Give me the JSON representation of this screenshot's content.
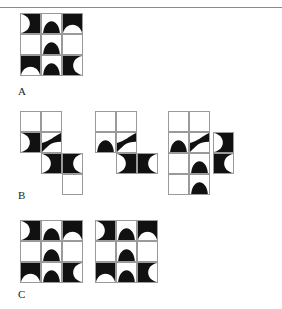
{
  "page": {
    "width": 282,
    "height": 309,
    "background": "#ffffff",
    "ink_color": "#111111",
    "grid_line_color": "#9a9a9a",
    "rule_color": "#8a8a8a",
    "has_top_rule": true
  },
  "labels": {
    "a": "A",
    "b": "B",
    "c": "C"
  },
  "figure_groups": [
    {
      "id": "group-a",
      "label": "A",
      "caption": "A",
      "figure_count": 1,
      "figures": [
        {
          "id": "a1",
          "name": "figure-a-1",
          "cols": 3,
          "rows": 3,
          "cell_size": 21,
          "x": 20,
          "y": 13,
          "cells": [
            {
              "col": 0,
              "row": 0,
              "tile": "arc-right"
            },
            {
              "col": 1,
              "row": 0,
              "tile": "hump-up"
            },
            {
              "col": 2,
              "row": 0,
              "tile": "arc-down"
            },
            {
              "col": 0,
              "row": 1,
              "tile": "blank"
            },
            {
              "col": 1,
              "row": 1,
              "tile": "hump-up"
            },
            {
              "col": 2,
              "row": 1,
              "tile": "blank"
            },
            {
              "col": 0,
              "row": 2,
              "tile": "arc-down"
            },
            {
              "col": 1,
              "row": 2,
              "tile": "hump-up"
            },
            {
              "col": 2,
              "row": 2,
              "tile": "arc-left"
            }
          ]
        }
      ]
    },
    {
      "id": "group-b",
      "label": "B",
      "caption": "B",
      "figure_count": 4,
      "figures": [
        {
          "id": "b1",
          "name": "figure-b-1",
          "cols": 3,
          "rows": 4,
          "cell_size": 21,
          "x": 20,
          "y": 111,
          "cells": [
            {
              "col": 0,
              "row": 0,
              "tile": "blank"
            },
            {
              "col": 1,
              "row": 0,
              "tile": "blank"
            },
            {
              "col": 0,
              "row": 1,
              "tile": "arc-right"
            },
            {
              "col": 1,
              "row": 1,
              "tile": "diag-nw-se"
            },
            {
              "col": 1,
              "row": 2,
              "tile": "arc-right"
            },
            {
              "col": 2,
              "row": 2,
              "tile": "arc-left"
            },
            {
              "col": 2,
              "row": 3,
              "tile": "blank"
            }
          ]
        },
        {
          "id": "b2",
          "name": "figure-b-2",
          "cols": 3,
          "rows": 3,
          "cell_size": 21,
          "x": 95,
          "y": 111,
          "cells": [
            {
              "col": 0,
              "row": 0,
              "tile": "blank"
            },
            {
              "col": 1,
              "row": 0,
              "tile": "blank"
            },
            {
              "col": 0,
              "row": 1,
              "tile": "hump-up"
            },
            {
              "col": 1,
              "row": 1,
              "tile": "diag-nw-se"
            },
            {
              "col": 1,
              "row": 2,
              "tile": "arc-right"
            },
            {
              "col": 2,
              "row": 2,
              "tile": "arc-left"
            }
          ]
        },
        {
          "id": "b3",
          "name": "figure-b-3",
          "cols": 2,
          "rows": 4,
          "cell_size": 21,
          "x": 168,
          "y": 111,
          "cells": [
            {
              "col": 0,
              "row": 0,
              "tile": "blank"
            },
            {
              "col": 1,
              "row": 0,
              "tile": "blank"
            },
            {
              "col": 0,
              "row": 1,
              "tile": "hump-up"
            },
            {
              "col": 1,
              "row": 1,
              "tile": "diag-nw-se"
            },
            {
              "col": 1,
              "row": 2,
              "tile": "hump-up"
            },
            {
              "col": 0,
              "row": 2,
              "tile": "blank"
            },
            {
              "col": 0,
              "row": 3,
              "tile": "blank"
            },
            {
              "col": 1,
              "row": 3,
              "tile": "hump-up"
            }
          ]
        },
        {
          "id": "b4",
          "name": "figure-b-4",
          "cols": 1,
          "rows": 2,
          "cell_size": 21,
          "x": 213,
          "y": 132,
          "cells": [
            {
              "col": 0,
              "row": 0,
              "tile": "arc-right"
            },
            {
              "col": 0,
              "row": 1,
              "tile": "arc-left"
            }
          ]
        }
      ]
    },
    {
      "id": "group-c",
      "label": "C",
      "caption": "C",
      "figure_count": 2,
      "figures": [
        {
          "id": "c1",
          "name": "figure-c-1",
          "cols": 3,
          "rows": 3,
          "cell_size": 21,
          "x": 20,
          "y": 220,
          "cells": [
            {
              "col": 0,
              "row": 0,
              "tile": "arc-right"
            },
            {
              "col": 1,
              "row": 0,
              "tile": "hump-up"
            },
            {
              "col": 2,
              "row": 0,
              "tile": "arc-down"
            },
            {
              "col": 0,
              "row": 1,
              "tile": "blank"
            },
            {
              "col": 1,
              "row": 1,
              "tile": "hump-up"
            },
            {
              "col": 2,
              "row": 1,
              "tile": "blank"
            },
            {
              "col": 0,
              "row": 2,
              "tile": "arc-down"
            },
            {
              "col": 1,
              "row": 2,
              "tile": "hump-up"
            },
            {
              "col": 2,
              "row": 2,
              "tile": "arc-left"
            }
          ]
        },
        {
          "id": "c2",
          "name": "figure-c-2",
          "cols": 3,
          "rows": 3,
          "cell_size": 21,
          "x": 95,
          "y": 220,
          "cells": [
            {
              "col": 0,
              "row": 0,
              "tile": "arc-right"
            },
            {
              "col": 1,
              "row": 0,
              "tile": "hump-up"
            },
            {
              "col": 2,
              "row": 0,
              "tile": "arc-down"
            },
            {
              "col": 0,
              "row": 1,
              "tile": "blank"
            },
            {
              "col": 1,
              "row": 1,
              "tile": "hump-up"
            },
            {
              "col": 2,
              "row": 1,
              "tile": "blank"
            },
            {
              "col": 0,
              "row": 2,
              "tile": "arc-down"
            },
            {
              "col": 1,
              "row": 2,
              "tile": "hump-up"
            },
            {
              "col": 2,
              "row": 2,
              "tile": "arc-left"
            }
          ]
        }
      ]
    }
  ],
  "label_positions": [
    {
      "label": "A",
      "x": 18,
      "y": 86
    },
    {
      "label": "B",
      "x": 18,
      "y": 190
    },
    {
      "label": "C",
      "x": 18,
      "y": 289
    }
  ]
}
